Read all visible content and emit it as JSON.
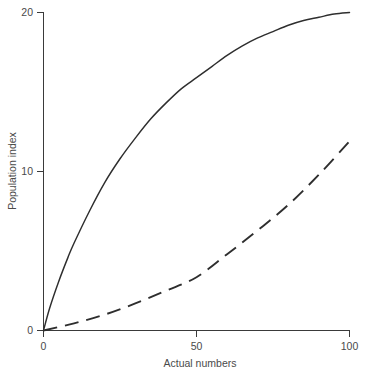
{
  "chart_data": {
    "type": "line",
    "title": "",
    "xlabel": "Actual numbers",
    "ylabel": "Population index",
    "xlim": [
      0,
      100
    ],
    "ylim": [
      0,
      20
    ],
    "xticks": [
      0,
      50,
      100
    ],
    "xticklabels": [
      "0",
      "50",
      "100"
    ],
    "yticks": [
      0,
      10,
      20
    ],
    "yticklabels": [
      "0",
      "10",
      "20"
    ],
    "grid": false,
    "legend": "none",
    "series": [
      {
        "name": "saturating-curve",
        "style": "solid",
        "color": "#2e2e2e",
        "x": [
          0,
          2,
          5,
          8,
          10,
          15,
          20,
          25,
          30,
          35,
          40,
          45,
          50,
          55,
          60,
          65,
          70,
          75,
          80,
          85,
          90,
          95,
          100
        ],
        "values": [
          0,
          1.4,
          3.1,
          4.6,
          5.5,
          7.5,
          9.3,
          10.8,
          12.1,
          13.3,
          14.3,
          15.2,
          15.9,
          16.6,
          17.3,
          17.9,
          18.4,
          18.8,
          19.2,
          19.5,
          19.7,
          19.9,
          20.0
        ]
      },
      {
        "name": "linear-reference",
        "style": "dashed",
        "color": "#2e2e2e",
        "x": [
          0,
          10,
          20,
          30,
          40,
          50,
          60,
          70,
          80,
          90,
          100
        ],
        "values": [
          0,
          0.45,
          1.0,
          1.7,
          2.5,
          3.35,
          4.8,
          6.3,
          7.9,
          9.8,
          11.9
        ]
      }
    ]
  },
  "axes": {
    "y_title": "Population index",
    "x_title": "Actual numbers",
    "y_tick_0": "0",
    "y_tick_10": "10",
    "y_tick_20": "20",
    "x_tick_0": "0",
    "x_tick_50": "50",
    "x_tick_100": "100"
  }
}
